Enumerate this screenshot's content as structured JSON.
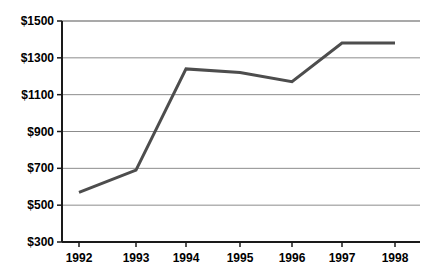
{
  "chart_data": {
    "type": "line",
    "title": "",
    "subtitle": "",
    "xlabel": "",
    "ylabel": "",
    "categories": [
      "1992",
      "1993",
      "1994",
      "1995",
      "1996",
      "1997",
      "1998"
    ],
    "x": [
      1992,
      1993,
      1994,
      1995,
      1996,
      1997,
      1998
    ],
    "values": [
      570,
      690,
      1240,
      1220,
      1170,
      1380,
      1380
    ],
    "series": [
      {
        "name": "",
        "values": [
          570,
          690,
          1240,
          1220,
          1170,
          1380,
          1380
        ],
        "color": "#4d4d4d"
      }
    ],
    "ylim": [
      300,
      1500
    ],
    "y_ticks": [
      300,
      500,
      700,
      900,
      1100,
      1300,
      1500
    ],
    "y_tick_labels": [
      "$300",
      "$500",
      "$700",
      "$900",
      "$1100",
      "$1300",
      "$1500"
    ],
    "x_tick_labels": [
      "1992",
      "1993",
      "1994",
      "1995",
      "1996",
      "1997",
      "1998"
    ],
    "grid": true,
    "grid_axis": "y",
    "legend": false,
    "legend_position": "none",
    "annotations": [],
    "colors": {
      "line": "#4d4d4d",
      "grid": "#8c8c8c",
      "axis": "#1a1a1a",
      "text": "#000000",
      "background": "#ffffff"
    }
  },
  "geometry": {
    "plot_left": 62,
    "plot_right": 420,
    "plot_top": 21,
    "plot_bottom": 242,
    "x_positions": [
      79,
      136,
      186,
      240,
      292,
      342,
      395
    ]
  }
}
